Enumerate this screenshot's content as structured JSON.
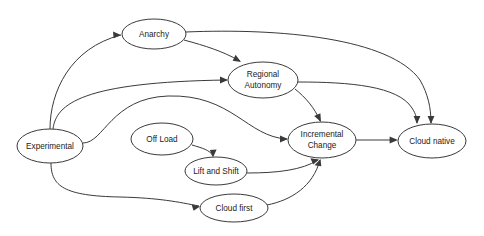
{
  "diagram": {
    "background_color": "#ffffff",
    "line_color": "#3a3a3a",
    "text_color": "#1a1a1a",
    "nodes": [
      {
        "id": "experimental",
        "label": "Experimental",
        "line1": "Experimental",
        "line2": "",
        "cx": 50,
        "cy": 146,
        "rx": 33,
        "ry": 17
      },
      {
        "id": "anarchy",
        "label": "Anarchy",
        "line1": "Anarchy",
        "line2": "",
        "cx": 154,
        "cy": 34,
        "rx": 32,
        "ry": 15
      },
      {
        "id": "regional_autonomy",
        "label": "Regional Autonomy",
        "line1": "Regional",
        "line2": "Autonomy",
        "cx": 263,
        "cy": 80,
        "rx": 35,
        "ry": 18
      },
      {
        "id": "incremental_change",
        "label": "Incremental Change",
        "line1": "Incremental",
        "line2": "Change",
        "cx": 322,
        "cy": 140,
        "rx": 34,
        "ry": 18
      },
      {
        "id": "cloud_native",
        "label": "Cloud native",
        "line1": "Cloud native",
        "line2": "",
        "cx": 432,
        "cy": 141,
        "rx": 34,
        "ry": 17
      },
      {
        "id": "off_load",
        "label": "Off Load",
        "line1": "Off Load",
        "line2": "",
        "cx": 162,
        "cy": 139,
        "rx": 31,
        "ry": 16
      },
      {
        "id": "lift_and_shift",
        "label": "Lift and Shift",
        "line1": "Lift and Shift",
        "line2": "",
        "cx": 216,
        "cy": 171,
        "rx": 31,
        "ry": 14
      },
      {
        "id": "cloud_first",
        "label": "Cloud first",
        "line1": "Cloud first",
        "line2": "",
        "cx": 234,
        "cy": 208,
        "rx": 34,
        "ry": 14
      }
    ],
    "edges": [
      {
        "id": "experimental-anarchy",
        "from": "Experimental",
        "to": "Anarchy"
      },
      {
        "id": "experimental-regional-autonomy",
        "from": "Experimental",
        "to": "Regional Autonomy"
      },
      {
        "id": "experimental-incremental-change",
        "from": "Experimental",
        "to": "Incremental Change"
      },
      {
        "id": "experimental-cloud-first",
        "from": "Experimental",
        "to": "Cloud first"
      },
      {
        "id": "anarchy-regional-autonomy",
        "from": "Anarchy",
        "to": "Regional Autonomy"
      },
      {
        "id": "anarchy-cloud-native",
        "from": "Anarchy",
        "to": "Cloud native"
      },
      {
        "id": "regional-autonomy-incremental",
        "from": "Regional Autonomy",
        "to": "Incremental Change"
      },
      {
        "id": "regional-autonomy-cloud-native",
        "from": "Regional Autonomy",
        "to": "Cloud native"
      },
      {
        "id": "off-load-lift-and-shift",
        "from": "Off Load",
        "to": "Lift and Shift"
      },
      {
        "id": "lift-and-shift-incremental",
        "from": "Lift and Shift",
        "to": "Incremental Change"
      },
      {
        "id": "cloud-first-incremental",
        "from": "Cloud first",
        "to": "Incremental Change"
      },
      {
        "id": "incremental-change-cloud-native",
        "from": "Incremental Change",
        "to": "Cloud native"
      }
    ]
  }
}
